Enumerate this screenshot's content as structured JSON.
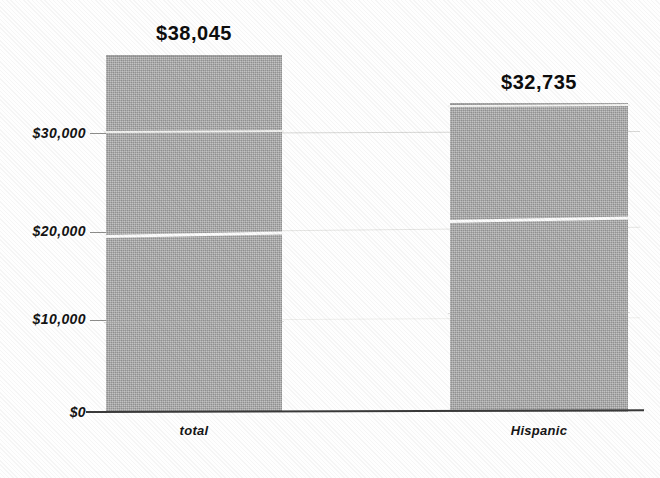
{
  "chart_data": {
    "type": "bar",
    "title": "",
    "subtitle": "",
    "xlabel": "",
    "ylabel": "",
    "categories": [
      "total",
      "Hispanic"
    ],
    "values": [
      38045,
      32735
    ],
    "value_labels": [
      "$38,045",
      "$32,735"
    ],
    "ylim": [
      0,
      40000
    ],
    "y_ticks": [
      0,
      10000,
      20000,
      30000
    ],
    "y_tick_labels": [
      "$0",
      "$10,000",
      "$20,000",
      "$30,000"
    ],
    "grid": true,
    "grid_axis": "y",
    "legend": false,
    "legend_position": "none",
    "bar_color": "#a9a9a9",
    "bar_texture": "halftone-dither-gray",
    "axis_color": "#3a3a3a",
    "gridline_color": "#dededc",
    "text_color": "#141414",
    "background_color": "#ffffff",
    "annotations": []
  },
  "axis": {
    "y_labels": [
      {
        "key": "y30000",
        "text": "$30,000"
      },
      {
        "key": "y20000",
        "text": "$20,000"
      },
      {
        "key": "y10000",
        "text": "$10,000"
      },
      {
        "key": "y0",
        "text": "$0"
      }
    ]
  },
  "bars": [
    {
      "category": "total",
      "value_label": "$38,045",
      "value": 38045
    },
    {
      "category": "Hispanic",
      "value_label": "$32,735",
      "value": 32735
    }
  ],
  "labels": {
    "cat_total": "total",
    "cat_hispanic": "Hispanic",
    "val_total": "$38,045",
    "val_hispanic": "$32,735",
    "tick_30000": "$30,000",
    "tick_20000": "$20,000",
    "tick_10000": "$10,000",
    "tick_0": "$0"
  }
}
